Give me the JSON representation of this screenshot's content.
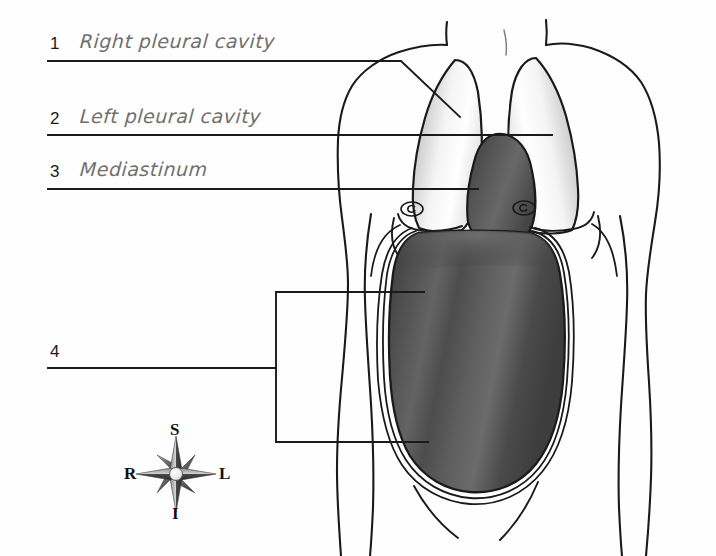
{
  "diagram": {
    "background_color": "#fefefe",
    "ink_color": "#1a1a1a",
    "handwriting_color": "#6f6f6f"
  },
  "labels": [
    {
      "number": "1",
      "text": "Right pleural cavity"
    },
    {
      "number": "2",
      "text": "Left pleural cavity"
    },
    {
      "number": "3",
      "text": "Mediastinum"
    },
    {
      "number": "4",
      "text": ""
    }
  ],
  "compass": {
    "name": "anatomical-direction-rose",
    "superior": "S",
    "inferior": "I",
    "right": "R",
    "left": "L"
  },
  "anatomy": {
    "regions": [
      {
        "name": "right-pleural-cavity",
        "fill": "#f2f2f2",
        "shade": "#9d9d9d"
      },
      {
        "name": "left-pleural-cavity",
        "fill": "#f2f2f2",
        "shade": "#9d9d9d"
      },
      {
        "name": "mediastinum",
        "fill": "#4e4e4e",
        "shade": "#3a3a3a"
      },
      {
        "name": "abdominopelvic-cavity",
        "fill": "#4a4a4a",
        "shade": "#383838"
      }
    ]
  }
}
